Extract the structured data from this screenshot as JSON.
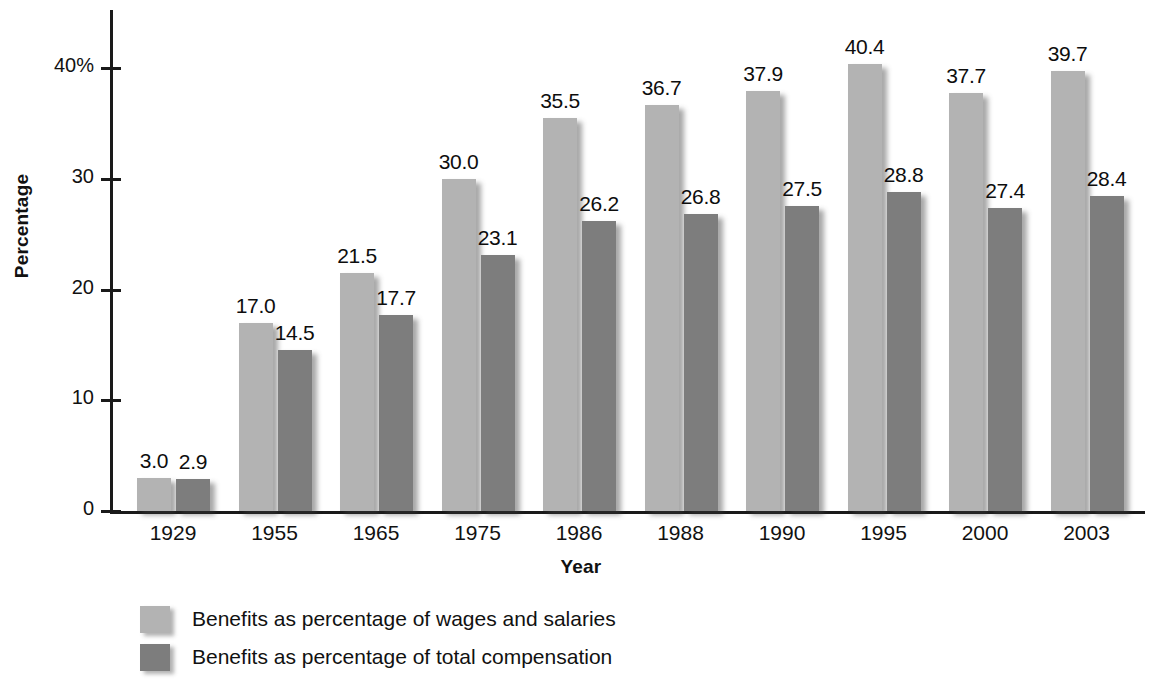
{
  "chart_data": {
    "type": "bar",
    "title": "",
    "xlabel": "Year",
    "ylabel": "Percentage",
    "categories": [
      "1929",
      "1955",
      "1965",
      "1975",
      "1986",
      "1988",
      "1990",
      "1995",
      "2000",
      "2003"
    ],
    "series": [
      {
        "name": "Benefits as percentage of wages and salaries",
        "color": "#b3b3b3",
        "values": [
          3.0,
          17.0,
          21.5,
          30.0,
          35.5,
          36.7,
          37.9,
          40.4,
          37.7,
          39.7
        ]
      },
      {
        "name": "Benefits as percentage of total compensation",
        "color": "#7d7d7d",
        "values": [
          2.9,
          14.5,
          17.7,
          23.1,
          26.2,
          26.8,
          27.5,
          28.8,
          27.4,
          28.4
        ]
      }
    ],
    "value_labels": [
      [
        "3.0",
        "17.0",
        "21.5",
        "30.0",
        "35.5",
        "36.7",
        "37.9",
        "40.4",
        "37.7",
        "39.7"
      ],
      [
        "2.9",
        "14.5",
        "17.7",
        "23.1",
        "26.2",
        "26.8",
        "27.5",
        "28.8",
        "27.4",
        "28.4"
      ]
    ],
    "ylim": [
      0,
      45
    ],
    "yticks": [
      0,
      10,
      20,
      30,
      40
    ],
    "ytick_labels": [
      "0",
      "10",
      "20",
      "30",
      "40%"
    ],
    "grid": false,
    "legend_position": "bottom-left"
  },
  "legend": {
    "items": [
      {
        "label": "Benefits as percentage of wages and salaries",
        "color": "#b3b3b3"
      },
      {
        "label": "Benefits as percentage of total compensation",
        "color": "#7d7d7d"
      }
    ]
  },
  "axes": {
    "y_axis_title": "Percentage",
    "x_axis_title": "Year"
  }
}
